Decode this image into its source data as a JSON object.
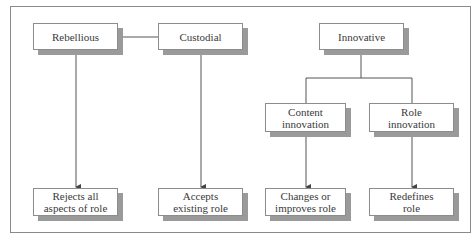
{
  "diagram": {
    "type": "hierarchy",
    "top_row": [
      {
        "id": "rebellious",
        "label": "Rebellious"
      },
      {
        "id": "custodial",
        "label": "Custodial"
      },
      {
        "id": "innovative",
        "label": "Innovative"
      }
    ],
    "middle_row": [
      {
        "id": "content_innovation",
        "label": "Content innovation",
        "parent": "innovative"
      },
      {
        "id": "role_innovation",
        "label": "Role innovation",
        "parent": "innovative"
      }
    ],
    "bottom_row": [
      {
        "id": "rejects",
        "label": "Rejects all aspects of role",
        "parent": "rebellious"
      },
      {
        "id": "accepts",
        "label": "Accepts existing role",
        "parent": "custodial"
      },
      {
        "id": "changes",
        "label": "Changes or improves role",
        "parent": "content_innovation"
      },
      {
        "id": "redefines",
        "label": "Redefines role",
        "parent": "role_innovation"
      }
    ],
    "edges": [
      {
        "from": "rebellious",
        "to": "custodial",
        "style": "line"
      },
      {
        "from": "rebellious",
        "to": "rejects",
        "style": "arrow"
      },
      {
        "from": "custodial",
        "to": "accepts",
        "style": "arrow"
      },
      {
        "from": "innovative",
        "to": "content_innovation",
        "style": "line"
      },
      {
        "from": "innovative",
        "to": "role_innovation",
        "style": "line"
      },
      {
        "from": "content_innovation",
        "to": "changes",
        "style": "arrow"
      },
      {
        "from": "role_innovation",
        "to": "redefines",
        "style": "arrow"
      }
    ]
  },
  "labels": {
    "rebellious": "Rebellious",
    "custodial": "Custodial",
    "innovative": "Innovative",
    "content_1": "Content",
    "content_2": "innovation",
    "role_1": "Role",
    "role_2": "innovation",
    "rejects_1": "Rejects all",
    "rejects_2": "aspects of role",
    "accepts_1": "Accepts",
    "accepts_2": "existing role",
    "changes_1": "Changes or",
    "changes_2": "improves role",
    "redefines_1": "Redefines",
    "redefines_2": "role"
  },
  "colors": {
    "border": "#8c8c8c",
    "shadow": "#9a9a9a",
    "line": "#555555",
    "text": "#3a3a3a"
  }
}
